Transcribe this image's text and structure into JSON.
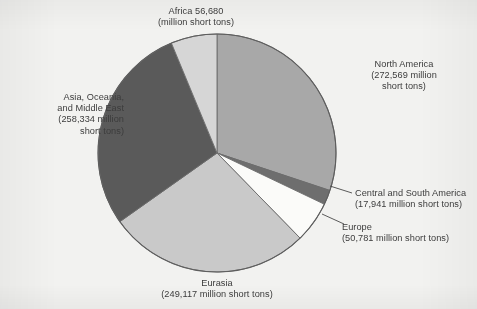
{
  "chart_data": {
    "type": "pie",
    "title": "",
    "subtitle": "",
    "unit": "million short tons",
    "total": 905422,
    "legend_position": "outside-callout-labels",
    "grid": false,
    "categories": [
      "North America",
      "Central and South America",
      "Europe",
      "Eurasia",
      "Asia, Oceania, and Middle East",
      "Africa"
    ],
    "values": [
      272569,
      17941,
      50781,
      249117,
      258334,
      56680
    ],
    "percentages": [
      30.1,
      2.0,
      5.6,
      27.5,
      28.5,
      6.3
    ],
    "colors": [
      "#a8a8a8",
      "#6e6e6e",
      "#fbfbf9",
      "#c9c9c9",
      "#5a5a5a",
      "#d6d6d6"
    ],
    "start_angle_deg": 0,
    "direction": "clockwise",
    "slices": [
      {
        "name": "North America",
        "value": 272569,
        "value_text": "272,569",
        "percent": 30.1,
        "color": "#a8a8a8",
        "label_lines": [
          "North America",
          "(272,569 million",
          "short tons)"
        ]
      },
      {
        "name": "Central and South America",
        "value": 17941,
        "value_text": "17,941",
        "percent": 2.0,
        "color": "#6e6e6e",
        "label_lines": [
          "Central and South America",
          "(17,941 million short tons)"
        ]
      },
      {
        "name": "Europe",
        "value": 50781,
        "value_text": "50,781",
        "percent": 5.6,
        "color": "#fbfbf9",
        "label_lines": [
          "Europe",
          "(50,781 million short tons)"
        ]
      },
      {
        "name": "Eurasia",
        "value": 249117,
        "value_text": "249,117",
        "percent": 27.5,
        "color": "#c9c9c9",
        "label_lines": [
          "Eurasia",
          "(249,117 million short tons)"
        ]
      },
      {
        "name": "Asia, Oceania, and Middle East",
        "value": 258334,
        "value_text": "258,334",
        "percent": 28.5,
        "color": "#5a5a5a",
        "label_lines": [
          "Asia, Oceania,",
          "and Middle East",
          "(258,334 million",
          "short tons)"
        ]
      },
      {
        "name": "Africa",
        "value": 56680,
        "value_text": "56,680",
        "percent": 6.3,
        "color": "#d6d6d6",
        "label_lines": [
          "Africa 56,680",
          "(million short tons)"
        ]
      }
    ]
  },
  "labels": {
    "africa": "Africa 56,680\n(million short tons)",
    "north_america": "North America\n(272,569 million\nshort tons)",
    "asia": "Asia, Oceania,\nand Middle East\n(258,334 million\nshort tons)",
    "central_south_america": "Central and South America\n(17,941 million short tons)",
    "europe": "Europe\n(50,781 million short tons)",
    "eurasia": "Eurasia\n(249,117 million short tons)"
  },
  "geometry": {
    "center_x": 217,
    "center_y": 153,
    "radius": 119
  }
}
